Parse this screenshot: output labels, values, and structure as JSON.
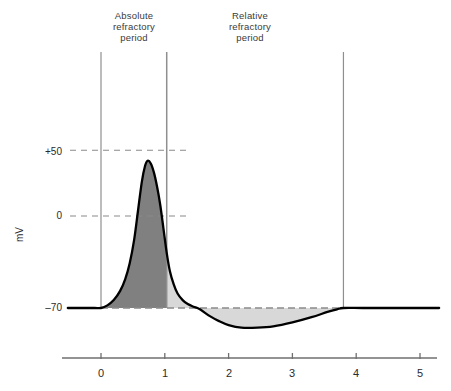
{
  "figure": {
    "axis_title_y": "mV",
    "annotations": [
      {
        "name": "absolute-refractory-period",
        "line1": "Absolute",
        "line2": "refractory",
        "line3": "period"
      },
      {
        "name": "relative-refractory-period",
        "line1": "Relative",
        "line2": "refractory",
        "line3": "period"
      }
    ],
    "y_tick_labels": [
      "+50",
      "0",
      "–70"
    ],
    "x_tick_labels": [
      "0",
      "1",
      "2",
      "3",
      "4",
      "5"
    ]
  },
  "colors": {
    "curve": "#000000",
    "absolute_fill": "#808080",
    "relative_fill": "#d8d8d8",
    "gridline": "#8a8a8a",
    "marker_line": "#8f8f8f",
    "axis": "#6f6f6f",
    "text": "#2b2b2b"
  },
  "chart_data": {
    "type": "line",
    "title": "",
    "xlabel": "",
    "ylabel": "mV",
    "xlim": [
      -0.52,
      5.3
    ],
    "ylim": [
      -90,
      62
    ],
    "yticks": [
      50,
      0,
      -70
    ],
    "ytick_labels": [
      "+50",
      "0",
      "–70"
    ],
    "xticks": [
      0,
      1,
      2,
      3,
      4,
      5
    ],
    "xtick_labels": [
      "0",
      "1",
      "2",
      "3",
      "4",
      "5"
    ],
    "grid": false,
    "dashed_gridlines": [
      50,
      0,
      -70
    ],
    "legend": null,
    "resting_potential": -70,
    "peak_potential": 42,
    "peak_time": 0.73,
    "trough_potential": -85,
    "trough_time": 2.2,
    "absolute_refractory_period": {
      "start": 0.0,
      "end": 1.03,
      "fill": "dark-gray"
    },
    "relative_refractory_period": {
      "start": 1.03,
      "end": 3.8,
      "fill": "light-gray"
    },
    "vertical_marker_times": [
      0.0,
      1.03,
      3.8
    ],
    "series": [
      {
        "name": "membrane potential",
        "x": [
          -0.52,
          -0.3,
          -0.1,
          0.0,
          0.1,
          0.2,
          0.3,
          0.38,
          0.45,
          0.52,
          0.58,
          0.64,
          0.69,
          0.73,
          0.78,
          0.83,
          0.88,
          0.93,
          0.98,
          1.03,
          1.08,
          1.14,
          1.2,
          1.28,
          1.36,
          1.45,
          1.55,
          1.7,
          1.85,
          2.0,
          2.2,
          2.45,
          2.7,
          3.0,
          3.3,
          3.55,
          3.7,
          3.8,
          4.1,
          4.6,
          5.3
        ],
        "y": [
          -70,
          -70,
          -70,
          -70,
          -68,
          -64,
          -57,
          -48,
          -36,
          -18,
          4,
          26,
          38,
          42,
          40,
          33,
          22,
          8,
          -10,
          -28,
          -42,
          -52,
          -59,
          -64,
          -67,
          -69,
          -71,
          -76,
          -80,
          -83,
          -85,
          -85,
          -84,
          -81,
          -77,
          -73,
          -71,
          -70,
          -70,
          -70,
          -70
        ]
      }
    ]
  }
}
